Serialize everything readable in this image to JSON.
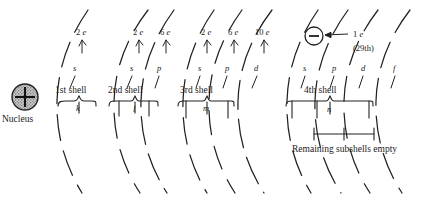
{
  "diagram": {
    "nucleus": {
      "label": "Nucleus",
      "charge_symbol": "+"
    },
    "electron_callout": {
      "charge_symbol": "−",
      "count_label": "1 e",
      "ordinal_label": "(29th)"
    },
    "remaining_note": "Remaining subshells empty",
    "shells": [
      {
        "name": "1st shell",
        "letter": "k",
        "subshells": [
          {
            "label": "s",
            "electrons": "2 e"
          }
        ]
      },
      {
        "name": "2nd shell",
        "letter": "l",
        "subshells": [
          {
            "label": "s",
            "electrons": "2 e"
          },
          {
            "label": "p",
            "electrons": "6 e"
          }
        ]
      },
      {
        "name": "3rd shell",
        "letter": "m",
        "subshells": [
          {
            "label": "s",
            "electrons": "2 e"
          },
          {
            "label": "p",
            "electrons": "6 e"
          },
          {
            "label": "d",
            "electrons": "10 e"
          }
        ]
      },
      {
        "name": "4th shell",
        "letter": "n",
        "subshells": [
          {
            "label": "s",
            "electrons": ""
          },
          {
            "label": "p",
            "electrons": ""
          },
          {
            "label": "d",
            "electrons": ""
          },
          {
            "label": "f",
            "electrons": ""
          }
        ]
      }
    ],
    "colors": {
      "ink": "#1a1a1a",
      "background": "#ffffff",
      "nucleus_fill": "#b9b9b9"
    }
  }
}
